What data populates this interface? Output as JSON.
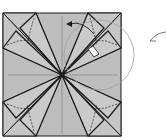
{
  "diagram": {
    "type": "origami-fold-step",
    "colors": {
      "paper": "#bdbdbd",
      "flap": "#c4c4c4",
      "edge": "#1a1a1a",
      "crease": "#8a8a8a",
      "circle": "#a0a0a0",
      "highlight": "#ffffff"
    },
    "square": {
      "x": 3,
      "y": 13,
      "w": 118,
      "h": 123
    },
    "center": {
      "x": 62,
      "y": 75
    },
    "detail_circle": {
      "cx": 99,
      "cy": 55,
      "r": 35
    },
    "annotations": [
      "rotate-arrow",
      "pointer-arrow",
      "highlighted-flap"
    ]
  }
}
